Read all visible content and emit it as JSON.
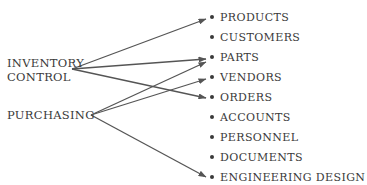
{
  "sources": [
    {
      "id": "inventory-control",
      "lines": [
        "INVENTORY",
        "CONTROL"
      ]
    },
    {
      "id": "purchasing",
      "lines": [
        "PURCHASING"
      ]
    }
  ],
  "targets": [
    "PRODUCTS",
    "CUSTOMERS",
    "PARTS",
    "VENDORS",
    "ORDERS",
    "ACCOUNTS",
    "PERSONNEL",
    "DOCUMENTS",
    "ENGINEERING DESIGN"
  ],
  "edges": [
    {
      "from": "INVENTORY CONTROL",
      "to": "PRODUCTS"
    },
    {
      "from": "INVENTORY CONTROL",
      "to": "PARTS"
    },
    {
      "from": "INVENTORY CONTROL",
      "to": "ORDERS"
    },
    {
      "from": "PURCHASING",
      "to": "PARTS"
    },
    {
      "from": "PURCHASING",
      "to": "VENDORS"
    },
    {
      "from": "PURCHASING",
      "to": "ENGINEERING DESIGN"
    }
  ],
  "colors": {
    "line": "#555555",
    "text": "#3a3a3a"
  }
}
